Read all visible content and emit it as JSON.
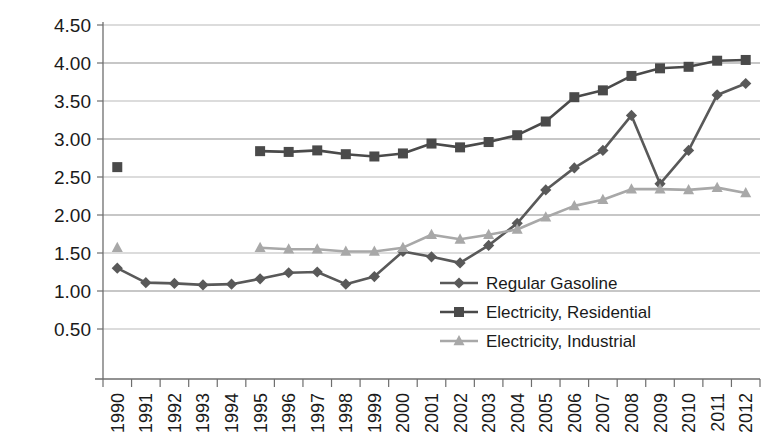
{
  "chart_data": {
    "type": "line",
    "title": "",
    "xlabel": "",
    "ylabel": "",
    "ylim": [
      0.0,
      4.5
    ],
    "ytick_labels": [
      "0.50",
      "1.00",
      "1.50",
      "2.00",
      "2.50",
      "3.00",
      "3.50",
      "4.00",
      "4.50"
    ],
    "ytick_values": [
      0.5,
      1.0,
      1.5,
      2.0,
      2.5,
      3.0,
      3.5,
      4.0,
      4.5
    ],
    "grid": true,
    "legend_position": "inside-right-lower",
    "categories": [
      "1990",
      "1991",
      "1992",
      "1993",
      "1994",
      "1995",
      "1996",
      "1997",
      "1998",
      "1999",
      "2000",
      "2001",
      "2002",
      "2003",
      "2004",
      "2005",
      "2006",
      "2007",
      "2008",
      "2009",
      "2010",
      "2011",
      "2012"
    ],
    "x": [
      1990,
      1991,
      1992,
      1993,
      1994,
      1995,
      1996,
      1997,
      1998,
      1999,
      2000,
      2001,
      2002,
      2003,
      2004,
      2005,
      2006,
      2007,
      2008,
      2009,
      2010,
      2011,
      2012
    ],
    "series": [
      {
        "name": "Regular Gasoline",
        "marker": "diamond",
        "color": "#595959",
        "values": [
          1.3,
          1.11,
          1.1,
          1.08,
          1.09,
          1.16,
          1.24,
          1.25,
          1.09,
          1.19,
          1.52,
          1.45,
          1.37,
          1.6,
          1.89,
          2.33,
          2.62,
          2.85,
          3.31,
          2.41,
          2.85,
          3.58,
          3.73
        ]
      },
      {
        "name": "Electricity, Residential",
        "marker": "square",
        "color": "#4a4a4a",
        "values": [
          2.63,
          null,
          null,
          null,
          null,
          2.84,
          2.83,
          2.85,
          2.8,
          2.77,
          2.81,
          2.94,
          2.89,
          2.96,
          3.05,
          3.23,
          3.55,
          3.64,
          3.83,
          3.93,
          3.95,
          4.03,
          4.04
        ]
      },
      {
        "name": "Electricity, Industrial",
        "marker": "triangle",
        "color": "#a8a8a8",
        "values": [
          1.57,
          null,
          null,
          null,
          null,
          1.57,
          1.55,
          1.55,
          1.52,
          1.52,
          1.57,
          1.74,
          1.68,
          1.74,
          1.81,
          1.97,
          2.12,
          2.2,
          2.34,
          2.34,
          2.33,
          2.36,
          2.29
        ]
      }
    ],
    "legend": [
      {
        "label": "Regular Gasoline",
        "marker": "diamond",
        "color": "#595959"
      },
      {
        "label": "Electricity, Residential",
        "marker": "square",
        "color": "#4a4a4a"
      },
      {
        "label": "Electricity, Industrial",
        "marker": "triangle",
        "color": "#a8a8a8"
      }
    ]
  }
}
